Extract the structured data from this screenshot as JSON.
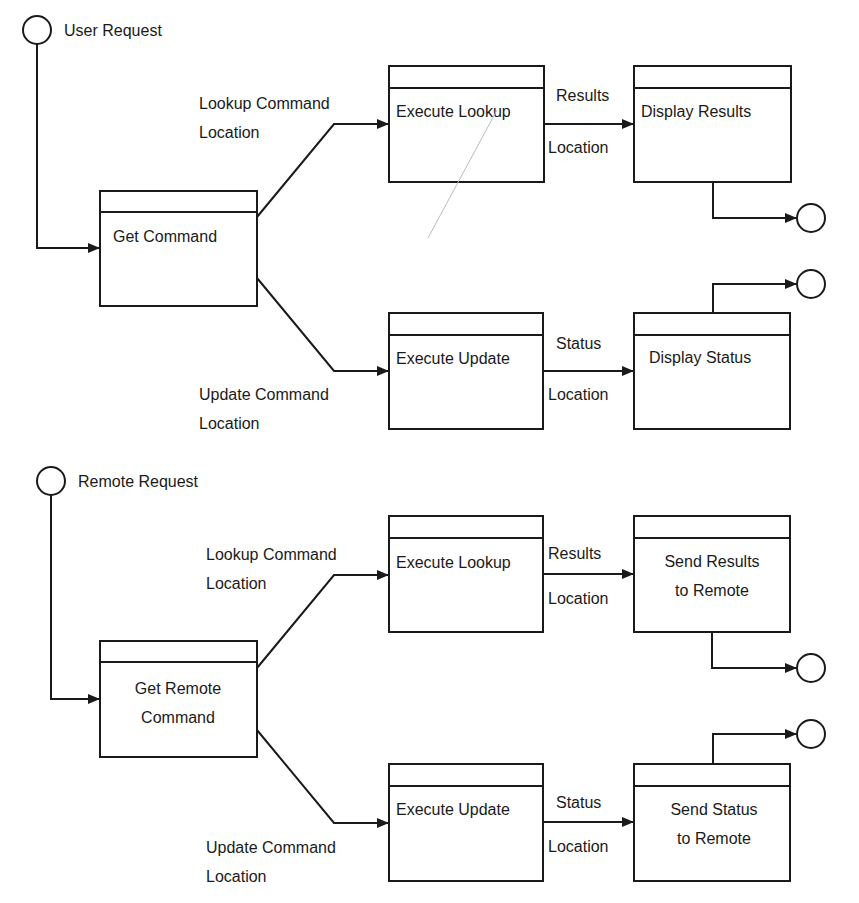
{
  "diagram": {
    "sections": [
      {
        "id": "user",
        "start": {
          "label": "User Request"
        },
        "source_process": {
          "lines": [
            "Get Command"
          ]
        },
        "branches": [
          {
            "input_label": [
              "Lookup Command",
              "Location"
            ],
            "process": {
              "lines": [
                "Execute Lookup"
              ]
            },
            "output_label": {
              "above": "Results",
              "below": "Location"
            },
            "target": {
              "lines": [
                "Display Results"
              ]
            }
          },
          {
            "input_label": [
              "Update Command",
              "Location"
            ],
            "process": {
              "lines": [
                "Execute Update"
              ]
            },
            "output_label": {
              "above": "Status",
              "below": "Location"
            },
            "target": {
              "lines": [
                "Display Status"
              ]
            }
          }
        ]
      },
      {
        "id": "remote",
        "start": {
          "label": "Remote Request"
        },
        "source_process": {
          "lines": [
            "Get Remote",
            "Command"
          ]
        },
        "branches": [
          {
            "input_label": [
              "Lookup Command",
              "Location"
            ],
            "process": {
              "lines": [
                "Execute Lookup"
              ]
            },
            "output_label": {
              "above": "Results",
              "below": "Location"
            },
            "target": {
              "lines": [
                "Send Results",
                "to Remote"
              ]
            }
          },
          {
            "input_label": [
              "Update Command",
              "Location"
            ],
            "process": {
              "lines": [
                "Execute Update"
              ]
            },
            "output_label": {
              "above": "Status",
              "below": "Location"
            },
            "target": {
              "lines": [
                "Send Status",
                "to Remote"
              ]
            }
          }
        ]
      }
    ]
  }
}
